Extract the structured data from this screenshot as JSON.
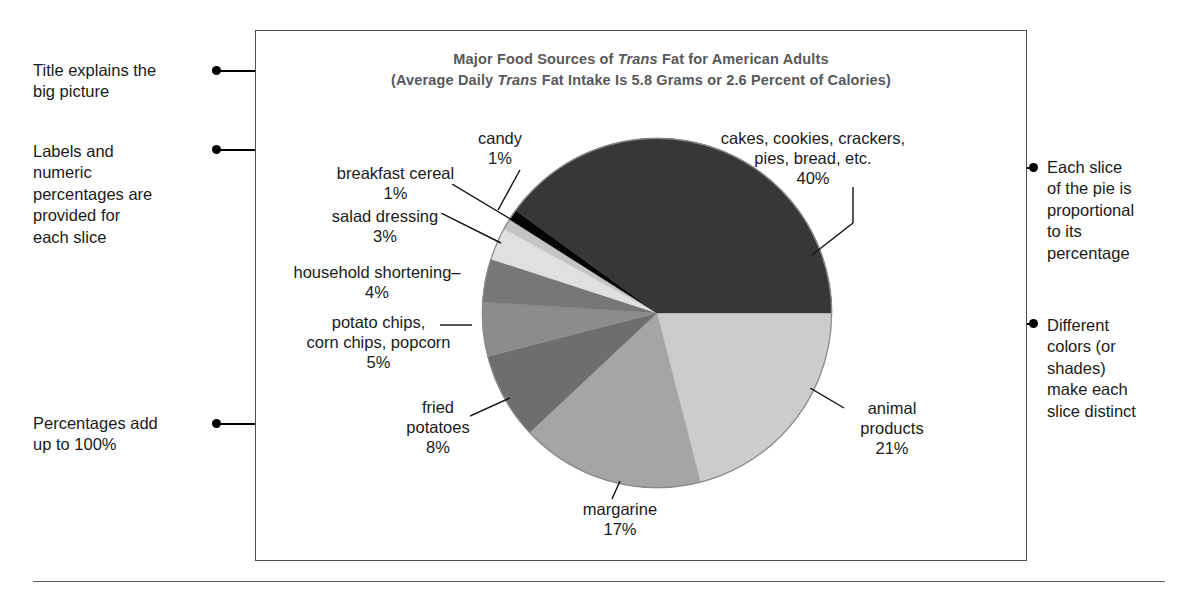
{
  "figure": {
    "title_line1_pre": "Major Food Sources of ",
    "title_line1_em": "Trans",
    "title_line1_post": " Fat for American Adults",
    "title_line2_pre": "(Average Daily ",
    "title_line2_em": "Trans",
    "title_line2_post": " Fat Intake Is 5.8 Grams or 2.6 Percent of Calories)",
    "frame_color": "#4d4d4d",
    "title_color": "#58595b"
  },
  "annotations": {
    "left": [
      {
        "name": "annotation-title-explains",
        "text": "Title explains the\nbig picture"
      },
      {
        "name": "annotation-labels-and-percentages",
        "text": "Labels and\nnumeric\npercentages are\nprovided for\neach slice"
      },
      {
        "name": "annotation-percentages-add-up",
        "text": "Percentages add\nup to 100%"
      }
    ],
    "right": [
      {
        "name": "annotation-each-slice-proportional",
        "text": "Each slice\nof the pie is\nproportional\nto its\npercentage"
      },
      {
        "name": "annotation-different-colors",
        "text": "Different\ncolors (or\nshades)\nmake each\nslice distinct"
      }
    ]
  },
  "chart_data": {
    "type": "pie",
    "title": "Major Food Sources of Trans Fat for American Adults",
    "subtitle": "(Average Daily Trans Fat Intake Is 5.8 Grams or 2.6 Percent of Calories)",
    "xlabel": "",
    "ylabel": "",
    "grid": false,
    "legend": "none (direct slice labels with leader lines)",
    "total_percent": 100,
    "units": "percent of trans fat intake",
    "labels": [
      "cakes, cookies, crackers, pies, bread, etc.",
      "animal products",
      "margarine",
      "fried potatoes",
      "potato chips, corn chips, popcorn",
      "household shortening",
      "salad dressing",
      "breakfast cereal",
      "candy"
    ],
    "values": [
      40,
      21,
      17,
      8,
      5,
      4,
      3,
      1,
      1
    ],
    "colors": [
      "#373737",
      "#cccccc",
      "#a5a5a5",
      "#6e6e6e",
      "#8c8c8c",
      "#777777",
      "#e0e0e0",
      "#c4c4c4",
      "#050505"
    ],
    "slices": [
      {
        "label": "cakes, cookies, crackers,\npies, bread, etc.",
        "value": 40,
        "display": "40%",
        "color": "#373737"
      },
      {
        "label": "animal products",
        "value": 21,
        "display": "21%",
        "color": "#cccccc"
      },
      {
        "label": "margarine",
        "value": 17,
        "display": "17%",
        "color": "#a5a5a5"
      },
      {
        "label": "fried potatoes",
        "value": 8,
        "display": "8%",
        "color": "#6e6e6e"
      },
      {
        "label": "potato chips,\ncorn chips, popcorn",
        "value": 5,
        "display": "5%",
        "color": "#8c8c8c"
      },
      {
        "label": "household shortening",
        "value": 4,
        "display": "4%",
        "color": "#777777"
      },
      {
        "label": "salad dressing",
        "value": 3,
        "display": "3%",
        "color": "#e0e0e0"
      },
      {
        "label": "breakfast cereal",
        "value": 1,
        "display": "1%",
        "color": "#c4c4c4"
      },
      {
        "label": "candy",
        "value": 1,
        "display": "1%",
        "color": "#050505"
      }
    ]
  },
  "pie_labels": {
    "candy": {
      "text": "candy",
      "pct": "1%"
    },
    "cereal": {
      "text": "breakfast cereal",
      "pct": "1%"
    },
    "dressing": {
      "text": "salad dressing",
      "pct": "3%"
    },
    "shortening": {
      "text": "household shortening–",
      "pct": "4%"
    },
    "chips": {
      "text": "potato chips,\ncorn chips, popcorn",
      "pct": "5%"
    },
    "fried": {
      "text": "fried\npotatoes",
      "pct": "8%"
    },
    "margarine": {
      "text": "margarine",
      "pct": "17%"
    },
    "animal": {
      "text": "animal\nproducts",
      "pct": "21%"
    },
    "cakes": {
      "text": "cakes, cookies, crackers,\npies, bread, etc.",
      "pct": "40%"
    }
  }
}
